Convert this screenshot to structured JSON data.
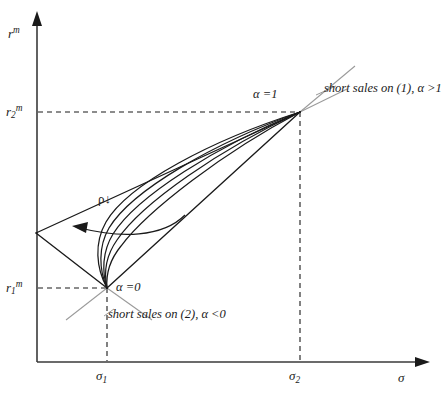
{
  "figure": {
    "type": "diagram",
    "background_color": "#ffffff",
    "line_color": "#1a1a1a",
    "accent_color": "#9a9a9a",
    "dash_color": "#1a1a1a"
  },
  "axes": {
    "y": {
      "label_main": "r",
      "label_sup": "m",
      "origin_px": [
        37,
        362
      ],
      "top_px": [
        37,
        14
      ],
      "arrow": "up"
    },
    "x": {
      "label_main": "σ",
      "origin_px": [
        37,
        362
      ],
      "right_px": [
        428,
        362
      ],
      "arrow": "right"
    }
  },
  "ticks": {
    "y": [
      {
        "id": "r2m",
        "base": "r",
        "sub": "2",
        "sup": "m",
        "y_px": 112
      },
      {
        "id": "r1m",
        "base": "r",
        "sub": "1",
        "sup": "m",
        "y_px": 288
      }
    ],
    "x": [
      {
        "id": "sigma1",
        "base": "σ",
        "sub": "1",
        "x_px": 107
      },
      {
        "id": "sigma2",
        "base": "σ",
        "sub": "2",
        "x_px": 300
      }
    ]
  },
  "points": {
    "alpha_zero": {
      "label_main": "α =",
      "label_value": "0",
      "x_px": 107,
      "y_px": 288
    },
    "alpha_one": {
      "label_main": "α =",
      "label_value": "1",
      "x_px": 300,
      "y_px": 112
    },
    "apex": {
      "x_px": 36,
      "y_px": 233
    }
  },
  "annotations": {
    "short_sales_1": "short sales on (1), α >1",
    "short_sales_2": "short sales on (2), α <0",
    "rho_arrow": "ρ↓"
  },
  "curves": {
    "count": 5,
    "note": "family of frontier hyperbolas between alpha=0 and alpha=1 for decreasing correlation rho"
  }
}
